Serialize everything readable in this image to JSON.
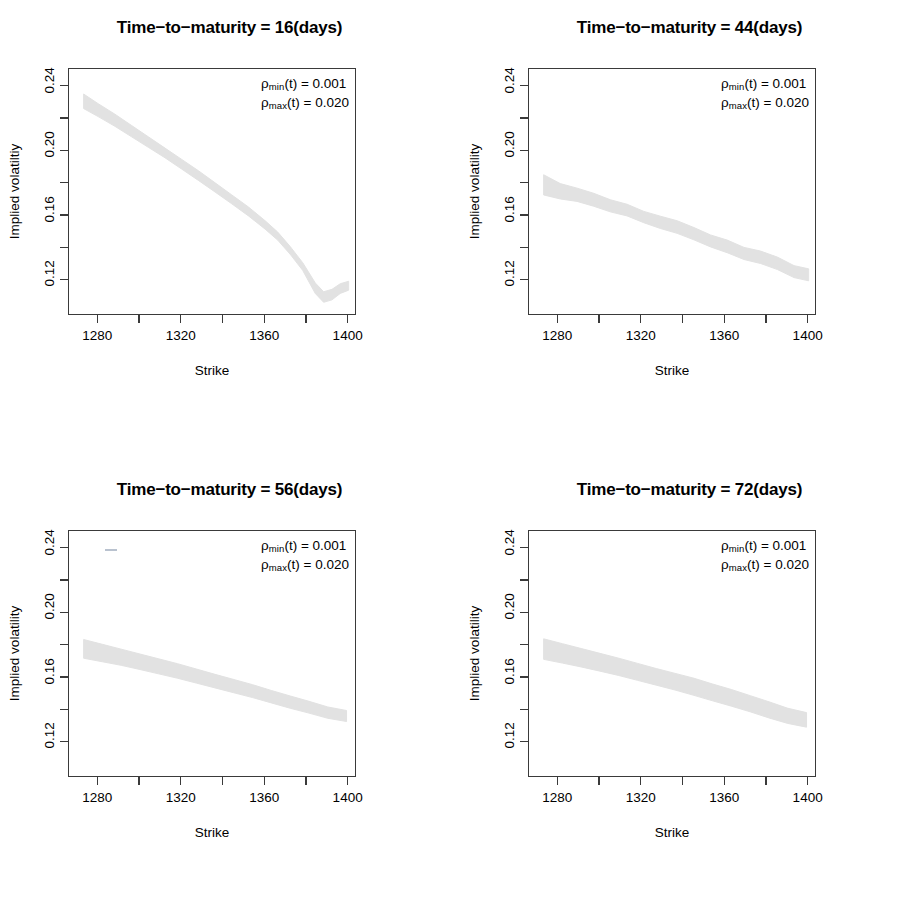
{
  "figure": {
    "width": 919,
    "height": 923,
    "background": "#ffffff",
    "band_color": "#e2e2e2",
    "axis_color": "#3a3a3a"
  },
  "chart_data": [
    {
      "type": "area",
      "id": "panel-16-days",
      "title": "Time−to−maturity = 16(days)",
      "xlabel": "Strike",
      "ylabel": "Implied volatiltiy",
      "xlim": [
        1266,
        1404
      ],
      "ylim": [
        0.098,
        0.251
      ],
      "xticks": [
        1280,
        1320,
        1360,
        1400
      ],
      "xtick_labels": [
        "1280",
        "1320",
        "1360",
        "1400"
      ],
      "xminor_ticks": [
        1260,
        1300,
        1340,
        1380
      ],
      "yticks": [
        0.12,
        0.16,
        0.2,
        0.24
      ],
      "ytick_labels": [
        "0.12",
        "0.16",
        "0.20",
        "0.24"
      ],
      "yminor_ticks": [
        0.14,
        0.18,
        0.22
      ],
      "grid": false,
      "annotations": [
        {
          "symbol": "ρ",
          "sub": "min",
          "arg": "(t)",
          "eq": "=",
          "value": "0.001"
        },
        {
          "symbol": "ρ",
          "sub": "max",
          "arg": "(t)",
          "eq": "=",
          "value": "0.020"
        }
      ],
      "x": [
        1273,
        1280,
        1288,
        1296,
        1304,
        1312,
        1320,
        1328,
        1336,
        1344,
        1352,
        1360,
        1366,
        1372,
        1378,
        1384,
        1388,
        1392,
        1396,
        1400
      ],
      "upper": [
        0.2355,
        0.2295,
        0.223,
        0.216,
        0.209,
        0.202,
        0.195,
        0.188,
        0.1805,
        0.173,
        0.1655,
        0.157,
        0.15,
        0.141,
        0.131,
        0.1185,
        0.113,
        0.1145,
        0.118,
        0.1195
      ],
      "lower": [
        0.2265,
        0.2215,
        0.2155,
        0.209,
        0.2025,
        0.196,
        0.189,
        0.182,
        0.1748,
        0.1675,
        0.16,
        0.1518,
        0.145,
        0.1362,
        0.1262,
        0.112,
        0.1065,
        0.108,
        0.112,
        0.114
      ]
    },
    {
      "type": "area",
      "id": "panel-44-days",
      "title": "Time−to−maturity = 44(days)",
      "xlabel": "Strike",
      "ylabel": "Implied volatility",
      "xlim": [
        1266,
        1404
      ],
      "ylim": [
        0.098,
        0.251
      ],
      "xticks": [
        1280,
        1320,
        1360,
        1400
      ],
      "xtick_labels": [
        "1280",
        "1320",
        "1360",
        "1400"
      ],
      "xminor_ticks": [
        1260,
        1300,
        1340,
        1380
      ],
      "yticks": [
        0.12,
        0.16,
        0.2,
        0.24
      ],
      "ytick_labels": [
        "0.12",
        "0.16",
        "0.20",
        "0.24"
      ],
      "yminor_ticks": [
        0.14,
        0.18,
        0.22
      ],
      "grid": false,
      "annotations": [
        {
          "symbol": "ρ",
          "sub": "min",
          "arg": "(t)",
          "eq": "=",
          "value": "0.001"
        },
        {
          "symbol": "ρ",
          "sub": "max",
          "arg": "(t)",
          "eq": "=",
          "value": "0.020"
        }
      ],
      "x": [
        1273,
        1281,
        1289,
        1297,
        1305,
        1313,
        1321,
        1329,
        1337,
        1345,
        1353,
        1361,
        1369,
        1377,
        1385,
        1393,
        1400
      ],
      "upper": [
        0.1855,
        0.18,
        0.1772,
        0.174,
        0.17,
        0.1672,
        0.1628,
        0.1598,
        0.157,
        0.1528,
        0.1482,
        0.145,
        0.1405,
        0.1382,
        0.1345,
        0.1292,
        0.1272
      ],
      "lower": [
        0.173,
        0.1705,
        0.169,
        0.166,
        0.1625,
        0.16,
        0.1558,
        0.1522,
        0.1492,
        0.1452,
        0.1408,
        0.1372,
        0.133,
        0.1305,
        0.1268,
        0.1218,
        0.1198
      ]
    },
    {
      "type": "area",
      "id": "panel-56-days",
      "title": "Time−to−maturity = 56(days)",
      "xlabel": "Strike",
      "ylabel": "Implied volatility",
      "xlim": [
        1266,
        1404
      ],
      "ylim": [
        0.098,
        0.251
      ],
      "xticks": [
        1280,
        1320,
        1360,
        1400
      ],
      "xtick_labels": [
        "1280",
        "1320",
        "1360",
        "1400"
      ],
      "xminor_ticks": [
        1260,
        1300,
        1340,
        1380
      ],
      "yticks": [
        0.12,
        0.16,
        0.2,
        0.24
      ],
      "ytick_labels": [
        "0.12",
        "0.16",
        "0.20",
        "0.24"
      ],
      "yminor_ticks": [
        0.14,
        0.18,
        0.22
      ],
      "grid": false,
      "annotations": [
        {
          "symbol": "ρ",
          "sub": "min",
          "arg": "(t)",
          "eq": "=",
          "value": "0.001"
        },
        {
          "symbol": "ρ",
          "sub": "max",
          "arg": "(t)",
          "eq": "=",
          "value": "0.020"
        }
      ],
      "x": [
        1273,
        1282,
        1291,
        1300,
        1309,
        1318,
        1327,
        1336,
        1345,
        1354,
        1363,
        1372,
        1381,
        1390,
        1399
      ],
      "upper": [
        0.1838,
        0.1808,
        0.1778,
        0.1748,
        0.1718,
        0.1688,
        0.1655,
        0.1622,
        0.159,
        0.1558,
        0.1522,
        0.1488,
        0.1455,
        0.142,
        0.1398
      ],
      "lower": [
        0.1722,
        0.17,
        0.1678,
        0.1652,
        0.1625,
        0.1598,
        0.1568,
        0.1538,
        0.1508,
        0.1478,
        0.1445,
        0.1412,
        0.1382,
        0.135,
        0.133
      ]
    },
    {
      "type": "area",
      "id": "panel-72-days",
      "title": "Time−to−maturity = 72(days)",
      "xlabel": "Strike",
      "ylabel": "Implied volatility",
      "xlim": [
        1266,
        1404
      ],
      "ylim": [
        0.098,
        0.251
      ],
      "xticks": [
        1280,
        1320,
        1360,
        1400
      ],
      "xtick_labels": [
        "1280",
        "1320",
        "1360",
        "1400"
      ],
      "xminor_ticks": [
        1260,
        1300,
        1340,
        1380
      ],
      "yticks": [
        0.12,
        0.16,
        0.2,
        0.24
      ],
      "ytick_labels": [
        "0.12",
        "0.16",
        "0.20",
        "0.24"
      ],
      "yminor_ticks": [
        0.14,
        0.18,
        0.22
      ],
      "grid": false,
      "annotations": [
        {
          "symbol": "ρ",
          "sub": "min",
          "arg": "(t)",
          "eq": "=",
          "value": "0.001"
        },
        {
          "symbol": "ρ",
          "sub": "max",
          "arg": "(t)",
          "eq": "=",
          "value": "0.020"
        }
      ],
      "x": [
        1273,
        1282,
        1291,
        1300,
        1309,
        1318,
        1327,
        1336,
        1345,
        1354,
        1363,
        1372,
        1381,
        1390,
        1399
      ],
      "upper": [
        0.1842,
        0.1812,
        0.1782,
        0.1752,
        0.1722,
        0.169,
        0.1658,
        0.1628,
        0.1598,
        0.1562,
        0.1528,
        0.149,
        0.1452,
        0.1412,
        0.1385
      ],
      "lower": [
        0.1715,
        0.1692,
        0.1668,
        0.1642,
        0.1615,
        0.1585,
        0.1555,
        0.1525,
        0.1492,
        0.1458,
        0.1425,
        0.139,
        0.1352,
        0.1318,
        0.1295
      ]
    }
  ]
}
